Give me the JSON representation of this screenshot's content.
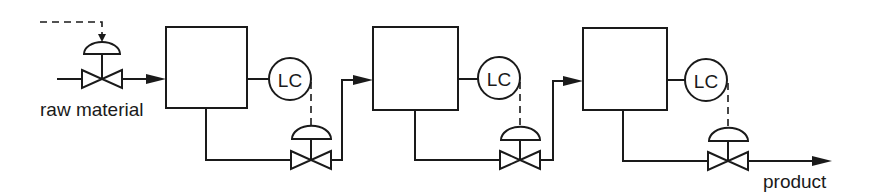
{
  "diagram": {
    "type": "process-flow",
    "colors": {
      "stroke": "#1a1a1a",
      "background": "#ffffff"
    },
    "inlet": {
      "label": "raw material"
    },
    "outlet": {
      "label": "product"
    },
    "tanks": [
      {
        "id": "tank-1",
        "controller": {
          "label": "LC"
        }
      },
      {
        "id": "tank-2",
        "controller": {
          "label": "LC"
        }
      },
      {
        "id": "tank-3",
        "controller": {
          "label": "LC"
        }
      }
    ],
    "valves": [
      {
        "id": "inlet-valve",
        "actuator": "diaphragm",
        "signal": "external-dashed"
      },
      {
        "id": "valve-1",
        "actuator": "diaphragm",
        "signal": "from-LC-1"
      },
      {
        "id": "valve-2",
        "actuator": "diaphragm",
        "signal": "from-LC-2"
      },
      {
        "id": "valve-3",
        "actuator": "diaphragm",
        "signal": "from-LC-3"
      }
    ]
  }
}
